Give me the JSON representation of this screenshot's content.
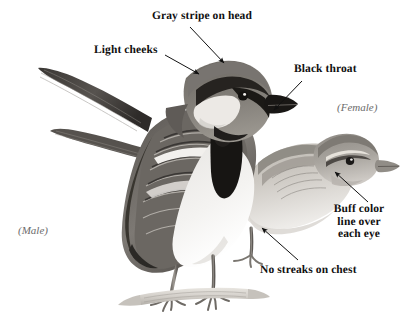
{
  "figure": {
    "kind": "field-guide-illustration",
    "background_color": "#ffffff",
    "ink_color": "#101010",
    "sex_label_color": "#6b6b6b",
    "width": 407,
    "height": 324
  },
  "annotations": {
    "gray_stripe": "Gray stripe on head",
    "light_cheeks": "Light cheeks",
    "black_throat": "Black throat",
    "buff_line_1": "Buff color",
    "buff_line_2": "line over",
    "buff_line_3": "each eye",
    "no_streaks": "No streaks on chest"
  },
  "sex_labels": {
    "male": "(Male)",
    "female": "(Female)"
  },
  "icons": {
    "leader_arrow": "arrow-icon"
  }
}
